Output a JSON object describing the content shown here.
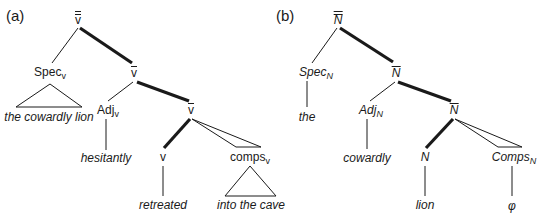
{
  "figure": {
    "panels": [
      {
        "id": "a",
        "label": "(a)",
        "nodes": {
          "root": {
            "base": "v",
            "bar": "double",
            "italic": false
          },
          "spec": {
            "base": "Spec",
            "sub": "v",
            "italic": false
          },
          "spec_leaf": "the cowardly lion",
          "vbar1": {
            "base": "v",
            "bar": "single",
            "italic": false
          },
          "adj": {
            "base": "Adj",
            "sub": "v",
            "italic": false
          },
          "adj_leaf": "hesitantly",
          "vbar2": {
            "base": "v",
            "bar": "single",
            "italic": false
          },
          "head": {
            "base": "v",
            "italic": false
          },
          "head_leaf": "retreated",
          "comps": {
            "base": "comps",
            "sub": "v",
            "italic": false
          },
          "comps_leaf": "into the cave"
        }
      },
      {
        "id": "b",
        "label": "(b)",
        "nodes": {
          "root": {
            "base": "N",
            "bar": "double",
            "italic": true
          },
          "spec": {
            "base": "Spec",
            "sub": "N",
            "italic": true
          },
          "spec_leaf": "the",
          "nbar1": {
            "base": "N",
            "bar": "single",
            "italic": true
          },
          "adj": {
            "base": "Adj",
            "sub": "N",
            "italic": true
          },
          "adj_leaf": "cowardly",
          "nbar2": {
            "base": "N",
            "bar": "single",
            "italic": true
          },
          "head": {
            "base": "N",
            "italic": true
          },
          "head_leaf": "lion",
          "comps": {
            "base": "Comps",
            "sub": "N",
            "italic": true
          },
          "comps_leaf": "φ"
        }
      }
    ],
    "colors": {
      "ink": "#1a1a1a",
      "background": "#ffffff"
    }
  }
}
